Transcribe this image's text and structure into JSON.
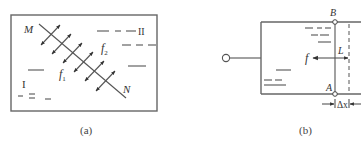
{
  "figure_a": {
    "caption": "(a)",
    "labels": {
      "line_start": "M",
      "line_end": "N",
      "phase_1": "I",
      "phase_2": "II",
      "force_1": "f",
      "force_1_sub": "1",
      "force_2": "f",
      "force_2_sub": "2"
    },
    "description": "Rectangular container with interface line MN separating phase I and phase II; double-headed arrows perpendicular to MN represent forces f1 and f2"
  },
  "figure_b": {
    "caption": "(b)",
    "labels": {
      "top_point": "B",
      "bottom_point": "A",
      "force": "f",
      "length": "L",
      "displacement": "Δx"
    },
    "description": "Frame with movable edge AB of length L; force f pulls AB left; dashed line shows displaced position after Δx"
  }
}
